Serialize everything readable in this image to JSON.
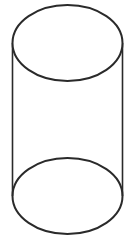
{
  "figure": {
    "shape": "cylinder",
    "stroke_color": "#2a2a2a",
    "background": "#ffffff",
    "top_ellipse": {
      "cx": 67.5,
      "cy": 43,
      "rx": 55,
      "ry": 38
    },
    "bottom_ellipse": {
      "cx": 67.5,
      "cy": 196,
      "rx": 55,
      "ry": 38
    },
    "left_side": {
      "x": 12.5,
      "y1": 43,
      "y2": 196
    },
    "right_side": {
      "x": 122.5,
      "y1": 43,
      "y2": 196
    }
  }
}
